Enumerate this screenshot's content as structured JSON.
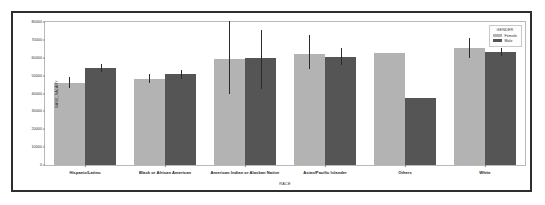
{
  "chart_data": {
    "type": "bar",
    "title": "",
    "xlabel": "RACE",
    "ylabel": "BASE_SALARY",
    "ylim": [
      0,
      80000
    ],
    "yticks": [
      0,
      10000,
      20000,
      30000,
      40000,
      50000,
      60000,
      70000,
      80000
    ],
    "grid": false,
    "legend": {
      "title": "GENDER",
      "position": "top-right",
      "entries": [
        {
          "name": "Female",
          "color": "#b3b3b3"
        },
        {
          "name": "Male",
          "color": "#555555"
        }
      ]
    },
    "categories": [
      "Hispanic/Latino",
      "Black or African American",
      "American Indian or Alaskan Native",
      "Asian/Pacific Islander",
      "Others",
      "White"
    ],
    "series": [
      {
        "name": "Female",
        "color": "#b3b3b3",
        "values": [
          46000,
          48300,
          59500,
          62300,
          62600,
          65500
        ],
        "error_low": [
          42800,
          45800,
          39700,
          53800,
          null,
          59800
        ],
        "error_high": [
          49300,
          51000,
          80700,
          72500,
          null,
          71300
        ]
      },
      {
        "name": "Male",
        "color": "#555555",
        "values": [
          54300,
          50700,
          59800,
          60300,
          37500,
          63000
        ],
        "error_low": [
          51800,
          48300,
          42600,
          55800,
          null,
          60700
        ],
        "error_high": [
          56600,
          52900,
          75500,
          65500,
          null,
          65200
        ]
      }
    ]
  }
}
